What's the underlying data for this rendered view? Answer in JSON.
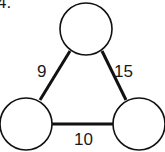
{
  "problem": {
    "number_label": "4."
  },
  "graph": {
    "nodes": [
      {
        "id": "top",
        "cx": 86,
        "cy": 29,
        "r": 26,
        "label": ""
      },
      {
        "id": "left",
        "cx": 26,
        "cy": 124,
        "r": 26,
        "label": ""
      },
      {
        "id": "right",
        "cx": 139,
        "cy": 124,
        "r": 26,
        "label": ""
      }
    ],
    "edges": [
      {
        "from": "top",
        "to": "left",
        "weight": "9"
      },
      {
        "from": "top",
        "to": "right",
        "weight": "15"
      },
      {
        "from": "left",
        "to": "right",
        "weight": "10"
      }
    ]
  },
  "colors": {
    "stroke": "#111111",
    "background": "#ffffff",
    "text": "#1a1a1a"
  }
}
